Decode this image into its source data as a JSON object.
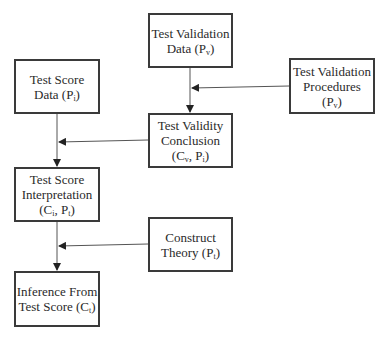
{
  "diagram": {
    "nodes": [
      {
        "id": "test-validation-data",
        "lines": [
          "Test Validation",
          "Data (P<sub>v</sub>)"
        ],
        "text": "Test Validation Data (Pv)"
      },
      {
        "id": "test-validation-procedures",
        "lines": [
          "Test Validation",
          "Procedures",
          "(P<sub>v</sub>)"
        ],
        "text": "Test Validation Procedures (Pv)"
      },
      {
        "id": "test-score-data",
        "lines": [
          "Test Score",
          "Data (P<sub>i</sub>)"
        ],
        "text": "Test Score Data (Pi)"
      },
      {
        "id": "test-validity-conclusion",
        "lines": [
          "Test Validity",
          "Conclusion",
          "(C<sub>v</sub>, P<sub>i</sub>)"
        ],
        "text": "Test Validity Conclusion (Cv, Pi)"
      },
      {
        "id": "test-score-interpretation",
        "lines": [
          "Test Score",
          "Interpretation",
          "(C<sub>i</sub>, P<sub>t</sub>)"
        ],
        "text": "Test Score Interpretation (Ci, Pt)"
      },
      {
        "id": "construct-theory",
        "lines": [
          "Construct",
          "Theory (P<sub>t</sub>)"
        ],
        "text": "Construct Theory (Pt)"
      },
      {
        "id": "inference-from-test-score",
        "lines": [
          "Inference From",
          "Test Score (C<sub>t</sub>)"
        ],
        "text": "Inference From Test Score (Ct)"
      }
    ],
    "edges": [
      {
        "from": "test-validation-data",
        "to": "test-validity-conclusion"
      },
      {
        "from": "test-validation-procedures",
        "to": "test-validation-data->test-validity-conclusion line"
      },
      {
        "from": "test-score-data",
        "to": "test-score-interpretation"
      },
      {
        "from": "test-validity-conclusion",
        "to": "test-score-data->test-score-interpretation line"
      },
      {
        "from": "test-score-interpretation",
        "to": "inference-from-test-score"
      },
      {
        "from": "construct-theory",
        "to": "test-score-interpretation->inference-from-test-score line"
      }
    ],
    "colors": {
      "border": "#3a3a3a",
      "line": "#555555",
      "text": "#2a2a2a",
      "background": "#ffffff"
    }
  }
}
